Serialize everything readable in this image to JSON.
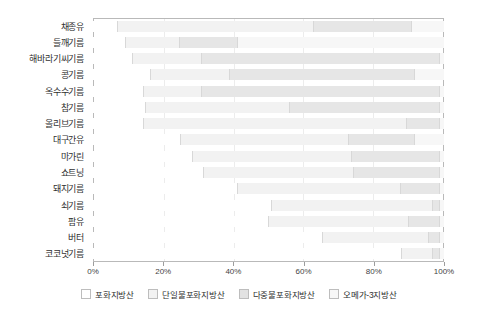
{
  "chart_data": {
    "type": "bar",
    "title": "",
    "subtitle": "",
    "xlabel": "",
    "ylabel": "",
    "orientation": "horizontal",
    "stacked": true,
    "normalized_percent": true,
    "xlim": [
      0,
      100
    ],
    "grid": true,
    "legend_position": "bottom",
    "xticks": [
      0,
      20,
      40,
      60,
      80,
      100
    ],
    "xticklabels": [
      "0%",
      "20%",
      "40%",
      "60%",
      "80%",
      "100%"
    ],
    "categories": [
      "채종유",
      "들깨기름",
      "해바라기씨기름",
      "콩기름",
      "옥수수기름",
      "참기름",
      "올리브기름",
      "대구간유",
      "마가린",
      "쇼트닝",
      "돼지기름",
      "쇠기름",
      "팜유",
      "버터",
      "코코넛기름"
    ],
    "series": [
      {
        "name": "포화지방산",
        "color": "#ffffff",
        "values": [
          7,
          9,
          11,
          16,
          13,
          15,
          14,
          24,
          27,
          31,
          41,
          49,
          50,
          63,
          82
        ]
      },
      {
        "name": "단일불포화지방산",
        "color": "#f2f2f2",
        "values": [
          56,
          15,
          19,
          22,
          15,
          41,
          72,
          46,
          43,
          42,
          46,
          44,
          40,
          29,
          8
        ]
      },
      {
        "name": "다중불포화지방산",
        "color": "#e6e6e6",
        "values": [
          28,
          16,
          66,
          51,
          61,
          43,
          9,
          18,
          24,
          24,
          11,
          2,
          9,
          3,
          2
        ]
      },
      {
        "name": "오메가-3지방산",
        "color": "#f7f7f7",
        "values": [
          9,
          57,
          1,
          8,
          1,
          1,
          1,
          8,
          1,
          1,
          1,
          1,
          1,
          1,
          1
        ]
      }
    ],
    "rows": [
      {
        "label": "채종유",
        "segments": [
          7,
          56,
          28,
          9
        ]
      },
      {
        "label": "들깨기름",
        "segments": [
          9,
          15,
          16,
          57
        ]
      },
      {
        "label": "해바라기씨기름",
        "segments": [
          11,
          19,
          66,
          1
        ]
      },
      {
        "label": "콩기름",
        "segments": [
          16,
          22,
          51,
          8
        ]
      },
      {
        "label": "옥수수기름",
        "segments": [
          13,
          15,
          61,
          1
        ]
      },
      {
        "label": "참기름",
        "segments": [
          15,
          41,
          43,
          1
        ]
      },
      {
        "label": "올리브기름",
        "segments": [
          14,
          72,
          9,
          1
        ]
      },
      {
        "label": "대구간유",
        "segments": [
          24,
          46,
          18,
          8
        ]
      },
      {
        "label": "마가린",
        "segments": [
          27,
          43,
          24,
          1
        ]
      },
      {
        "label": "쇼트닝",
        "segments": [
          31,
          42,
          24,
          1
        ]
      },
      {
        "label": "돼지기름",
        "segments": [
          41,
          46,
          11,
          1
        ]
      },
      {
        "label": "쇠기름",
        "segments": [
          49,
          44,
          2,
          1
        ]
      },
      {
        "label": "팜유",
        "segments": [
          50,
          40,
          9,
          1
        ]
      },
      {
        "label": "버터",
        "segments": [
          63,
          29,
          3,
          1
        ]
      },
      {
        "label": "코코넛기름",
        "segments": [
          82,
          8,
          2,
          1
        ]
      }
    ],
    "legend": [
      {
        "label": "포화지방산",
        "color": "#ffffff"
      },
      {
        "label": "단일불포화지방산",
        "color": "#f2f2f2"
      },
      {
        "label": "다중불포화지방산",
        "color": "#e2e2e2"
      },
      {
        "label": "오메가-3지방산",
        "color": "#f7f7f7"
      }
    ]
  },
  "colors": {
    "frame": "#b9b9b9",
    "gridline": "#ececec",
    "text": "#2f2f2f",
    "background": "#ffffff"
  }
}
